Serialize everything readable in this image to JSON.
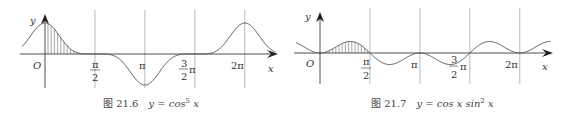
{
  "chart_data": [
    {
      "type": "line",
      "title": "图 21.6",
      "caption_formula": "y = cos⁵ x",
      "function": "cos^5(x)",
      "xlabel": "x",
      "ylabel": "y",
      "origin_label": "O",
      "xlim": [
        -0.72,
        7.25
      ],
      "ylim": [
        -1,
        1
      ],
      "xticks": [
        {
          "value": 1.5708,
          "label_num": "π",
          "label_den": "2",
          "fraction": true
        },
        {
          "value": 3.1416,
          "label": "π"
        },
        {
          "value": 4.7124,
          "label_num": "3",
          "label_den": "2",
          "suffix": "π",
          "fraction": true
        },
        {
          "value": 6.2832,
          "label": "2π"
        }
      ],
      "vertical_gridlines_at": [
        1.5708,
        3.1416,
        4.7124,
        6.2832
      ],
      "shaded_region": {
        "from": 0,
        "to": 1.5708,
        "style": "vertical hatching"
      }
    },
    {
      "type": "line",
      "title": "图 21.7",
      "caption_formula": "y = cos x sin² x",
      "function": "cos(x)*sin^2(x)",
      "xlabel": "x",
      "ylabel": "y",
      "origin_label": "O",
      "xlim": [
        -0.75,
        7.25
      ],
      "ylim": [
        -0.385,
        0.385
      ],
      "xticks": [
        {
          "value": 1.5708,
          "label_num": "π",
          "label_den": "2",
          "fraction": true
        },
        {
          "value": 3.1416,
          "label": "π"
        },
        {
          "value": 4.7124,
          "label_num": "3",
          "label_den": "2",
          "suffix": "π",
          "fraction": true
        },
        {
          "value": 6.2832,
          "label": "2π"
        }
      ],
      "vertical_gridlines_at": [
        1.5708,
        3.1416,
        4.7124,
        6.2832
      ],
      "shaded_region": {
        "from": 0,
        "to": 1.5708,
        "style": "vertical hatching"
      }
    }
  ],
  "captions": [
    {
      "fig": "图 21.6",
      "formula_pre": "y = cos",
      "sup": "5",
      "formula_post": " x"
    },
    {
      "fig": "图 21.7",
      "formula_pre": "y = cos x sin",
      "sup": "2",
      "formula_post": " x"
    }
  ],
  "colors": {
    "curve": "#555555",
    "axis": "#222222",
    "grid": "#999999",
    "hatch": "#666666"
  }
}
